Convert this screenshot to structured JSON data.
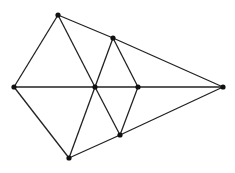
{
  "diagram": {
    "width": 235,
    "height": 173,
    "stroke_color": "#222222",
    "point_color": "#111111",
    "points": [
      {
        "id": "A",
        "x": 58,
        "y": 15
      },
      {
        "id": "B",
        "x": 113,
        "y": 38
      },
      {
        "id": "C",
        "x": 14,
        "y": 87
      },
      {
        "id": "D",
        "x": 95,
        "y": 87
      },
      {
        "id": "E",
        "x": 138,
        "y": 87
      },
      {
        "id": "F",
        "x": 223,
        "y": 87
      },
      {
        "id": "G",
        "x": 120,
        "y": 135
      },
      {
        "id": "H",
        "x": 69,
        "y": 158
      }
    ],
    "edges": [
      [
        "C",
        "A"
      ],
      [
        "A",
        "B"
      ],
      [
        "B",
        "F"
      ],
      [
        "A",
        "D"
      ],
      [
        "D",
        "G"
      ],
      [
        "B",
        "D"
      ],
      [
        "D",
        "H"
      ],
      [
        "B",
        "E"
      ],
      [
        "E",
        "G"
      ],
      [
        "C",
        "D"
      ],
      [
        "D",
        "E"
      ],
      [
        "E",
        "F"
      ],
      [
        "C",
        "H"
      ],
      [
        "H",
        "G"
      ],
      [
        "G",
        "F"
      ]
    ]
  }
}
